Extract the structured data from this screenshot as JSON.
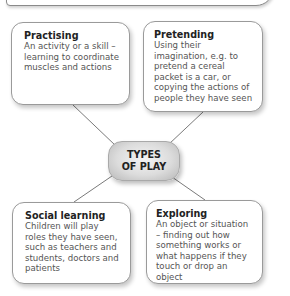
{
  "diagram": {
    "center": {
      "line1": "TYPES",
      "line2": "OF PLAY"
    },
    "nodes": [
      {
        "id": "practising",
        "title": "Practising",
        "description": "An activity or a skill – learning to coordinate muscles and actions"
      },
      {
        "id": "pretending",
        "title": "Pretending",
        "description": "Using their imagination, e.g. to pretend a cereal packet is a car, or copying the actions of people they have seen"
      },
      {
        "id": "social-learning",
        "title": "Social learning",
        "description": "Children will play roles they have seen, such as teachers and students, doctors and patients"
      },
      {
        "id": "exploring",
        "title": "Exploring",
        "description": "An object or situation – finding out how something works or what happens if they touch or drop an object"
      }
    ],
    "colors": {
      "border": "#9a9a9a",
      "line": "#7a7a7a",
      "title": "#222222",
      "text": "#555555",
      "center_fill": "#dcdcdc"
    }
  }
}
